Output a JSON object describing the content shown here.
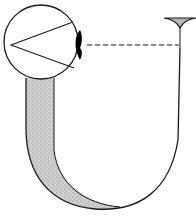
{
  "diagram": {
    "colors": {
      "stroke": "#1a1a1a",
      "stipple": "#c8c8c8",
      "stipple_dark": "#9a9a9a",
      "background": "#ffffff",
      "lens": "#000000"
    },
    "elements": [
      {
        "id": "eye-circle",
        "shape": "circle",
        "cx": 41,
        "cy": 42,
        "r": 38
      },
      {
        "id": "sight-lines",
        "shape": "polyline",
        "points": "11,45 73,21 11,45 74,69"
      },
      {
        "id": "lens",
        "shape": "black crescent",
        "x": 80,
        "y": 43
      },
      {
        "id": "dashed-level-line",
        "shape": "dashed line",
        "x1": 86,
        "y1": 45,
        "x2": 179,
        "y2": 45
      },
      {
        "id": "left-arm",
        "shape": "stippled tube",
        "x": 26,
        "width": 28
      },
      {
        "id": "u-bend",
        "shape": "curve"
      },
      {
        "id": "right-arm",
        "shape": "thin line",
        "x": 180
      },
      {
        "id": "funnel",
        "shape": "triangle",
        "x": 180,
        "y": 18
      }
    ]
  }
}
